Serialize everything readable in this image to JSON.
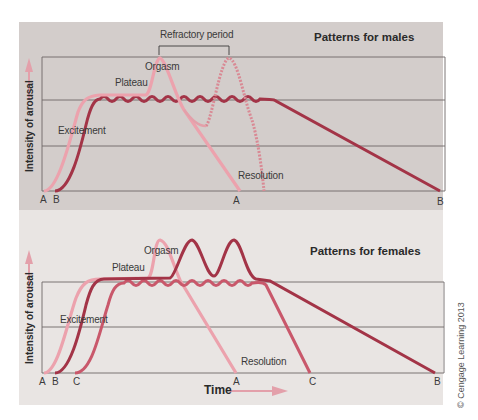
{
  "colors": {
    "males_bg": "#d3cdcb",
    "females_bg": "#e9e5e3",
    "line_A": "#eca2ad",
    "line_B": "#a33447",
    "line_C": "#c9586b",
    "axis_arrow": "#e7a4ae"
  },
  "males": {
    "title": "Patterns for males",
    "ylabel": "Intensity of arousal",
    "labels": {
      "refractory": "Refractory period",
      "orgasm": "Orgasm",
      "plateau": "Plateau",
      "excitement": "Excitement",
      "resolution": "Resolution"
    },
    "ticks": {
      "a_start": "A",
      "b_start": "B",
      "a_end": "A",
      "b_end": "B"
    }
  },
  "females": {
    "title": "Patterns for females",
    "ylabel": "Intensity of arousal",
    "xlabel": "Time",
    "labels": {
      "orgasm": "Orgasm",
      "plateau": "Plateau",
      "excitement": "Excitement",
      "resolution": "Resolution"
    },
    "ticks": {
      "a_start": "A",
      "b_start": "B",
      "c_start": "C",
      "a_end": "A",
      "c_end": "C",
      "b_end": "B"
    }
  },
  "copyright": "© Cengage Learning 2013"
}
